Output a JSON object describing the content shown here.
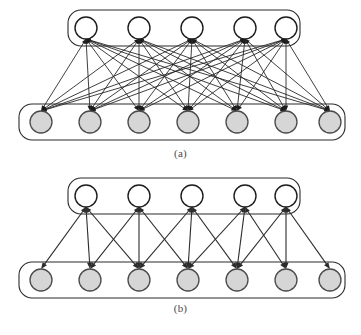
{
  "figure": {
    "title": "",
    "background_color": "#ffffff",
    "panels": [
      {
        "id": "a",
        "caption": "(a)",
        "connectivity": "fully-connected",
        "description": "Every unit in the top layer is connected to every unit in the bottom layer.",
        "top_layer": {
          "node_count": 5,
          "node_fill": "#ffffff",
          "node_stroke": "#1d1d1d",
          "node_radius": 11,
          "center_y": 28,
          "centers_x": [
            86,
            139,
            192,
            245,
            286
          ],
          "box": {
            "x": 68,
            "y": 10,
            "width": 232,
            "height": 36,
            "radius": 13
          }
        },
        "bottom_layer": {
          "node_count": 7,
          "node_fill": "#d6d6d6",
          "node_stroke": "#4a4a4a",
          "node_radius": 11,
          "center_y": 122,
          "centers_x": [
            41,
            90,
            139,
            188,
            237,
            286,
            330
          ],
          "box": {
            "x": 19,
            "y": 104,
            "width": 326,
            "height": 36,
            "radius": 13
          }
        },
        "edge_count": 35,
        "edge_color": "#1d1d1d",
        "edges": [
          [
            0,
            0
          ],
          [
            0,
            1
          ],
          [
            0,
            2
          ],
          [
            0,
            3
          ],
          [
            0,
            4
          ],
          [
            0,
            5
          ],
          [
            0,
            6
          ],
          [
            1,
            0
          ],
          [
            1,
            1
          ],
          [
            1,
            2
          ],
          [
            1,
            3
          ],
          [
            1,
            4
          ],
          [
            1,
            5
          ],
          [
            1,
            6
          ],
          [
            2,
            0
          ],
          [
            2,
            1
          ],
          [
            2,
            2
          ],
          [
            2,
            3
          ],
          [
            2,
            4
          ],
          [
            2,
            5
          ],
          [
            2,
            6
          ],
          [
            3,
            0
          ],
          [
            3,
            1
          ],
          [
            3,
            2
          ],
          [
            3,
            3
          ],
          [
            3,
            4
          ],
          [
            3,
            5
          ],
          [
            3,
            6
          ],
          [
            4,
            0
          ],
          [
            4,
            1
          ],
          [
            4,
            2
          ],
          [
            4,
            3
          ],
          [
            4,
            4
          ],
          [
            4,
            5
          ],
          [
            4,
            6
          ]
        ]
      },
      {
        "id": "b",
        "caption": "(b)",
        "connectivity": "locally-connected",
        "description": "Each unit in the top layer is connected to a local receptive field of three adjacent units in the bottom layer.",
        "top_layer": {
          "node_count": 5,
          "node_fill": "#ffffff",
          "node_stroke": "#1d1d1d",
          "node_radius": 11,
          "center_y": 26,
          "centers_x": [
            86,
            139,
            192,
            245,
            286
          ],
          "box": {
            "x": 68,
            "y": 8,
            "width": 232,
            "height": 36,
            "radius": 13
          }
        },
        "bottom_layer": {
          "node_count": 7,
          "node_fill": "#d6d6d6",
          "node_stroke": "#4a4a4a",
          "node_radius": 11,
          "center_y": 110,
          "centers_x": [
            41,
            90,
            139,
            188,
            237,
            286,
            330
          ],
          "box": {
            "x": 19,
            "y": 92,
            "width": 326,
            "height": 36,
            "radius": 13
          }
        },
        "edge_count": 15,
        "edge_color": "#2b2b2b",
        "receptive_field_size": 3,
        "edges": [
          [
            0,
            0
          ],
          [
            0,
            1
          ],
          [
            0,
            2
          ],
          [
            1,
            1
          ],
          [
            1,
            2
          ],
          [
            1,
            3
          ],
          [
            2,
            2
          ],
          [
            2,
            3
          ],
          [
            2,
            4
          ],
          [
            3,
            3
          ],
          [
            3,
            4
          ],
          [
            3,
            5
          ],
          [
            4,
            4
          ],
          [
            4,
            5
          ],
          [
            4,
            6
          ]
        ]
      }
    ]
  }
}
